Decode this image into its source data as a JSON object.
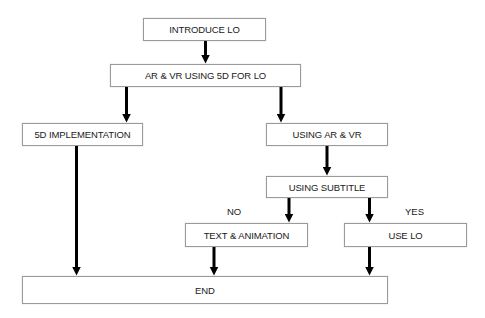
{
  "diagram": {
    "type": "flowchart",
    "nodes": [
      {
        "id": "introduce",
        "label": "INTRODUCE LO"
      },
      {
        "id": "arvr5d",
        "label": "AR & VR USING 5D FOR LO"
      },
      {
        "id": "impl5d",
        "label": "5D IMPLEMENTATION"
      },
      {
        "id": "usingarvr",
        "label": "USING AR & VR"
      },
      {
        "id": "subtitle",
        "label": "USING SUBTITLE"
      },
      {
        "id": "textanim",
        "label": "TEXT & ANIMATION"
      },
      {
        "id": "uselo",
        "label": "USE LO"
      },
      {
        "id": "end",
        "label": "END"
      }
    ],
    "edge_labels": {
      "no": "NO",
      "yes": "YES"
    },
    "edges": [
      {
        "from": "introduce",
        "to": "arvr5d"
      },
      {
        "from": "arvr5d",
        "to": "impl5d"
      },
      {
        "from": "arvr5d",
        "to": "usingarvr"
      },
      {
        "from": "usingarvr",
        "to": "subtitle"
      },
      {
        "from": "subtitle",
        "to": "textanim",
        "label": "NO"
      },
      {
        "from": "subtitle",
        "to": "uselo",
        "label": "YES"
      },
      {
        "from": "impl5d",
        "to": "end"
      },
      {
        "from": "textanim",
        "to": "end"
      },
      {
        "from": "uselo",
        "to": "end"
      }
    ],
    "colors": {
      "arrow": "#000000",
      "box_border": "#9a9a9a",
      "background": "#ffffff"
    }
  }
}
